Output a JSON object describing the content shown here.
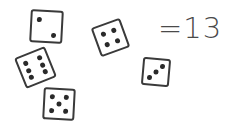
{
  "equation": {
    "text": "=13",
    "operator": "=",
    "value": "13"
  },
  "dice": [
    {
      "id": "die-two",
      "face_value": 2,
      "left": 30,
      "top": 10,
      "size": 33,
      "rotate": 3,
      "pips": [
        [
          25,
          28
        ],
        [
          75,
          78
        ]
      ]
    },
    {
      "id": "die-six",
      "face_value": 6,
      "left": 19,
      "top": 51,
      "size": 33,
      "rotate": -22,
      "pips": [
        [
          25,
          25
        ],
        [
          75,
          25
        ],
        [
          25,
          50
        ],
        [
          75,
          50
        ],
        [
          25,
          75
        ],
        [
          75,
          75
        ]
      ]
    },
    {
      "id": "die-five",
      "face_value": 5,
      "left": 43,
      "top": 88,
      "size": 32,
      "rotate": 3,
      "pips": [
        [
          25,
          25
        ],
        [
          75,
          25
        ],
        [
          50,
          50
        ],
        [
          25,
          75
        ],
        [
          75,
          75
        ]
      ]
    },
    {
      "id": "die-four",
      "face_value": 4,
      "left": 95,
      "top": 22,
      "size": 31,
      "rotate": -20,
      "pips": [
        [
          28,
          28
        ],
        [
          72,
          28
        ],
        [
          28,
          72
        ],
        [
          72,
          72
        ]
      ]
    },
    {
      "id": "die-three",
      "face_value": 3,
      "left": 142,
      "top": 58,
      "size": 28,
      "rotate": 5,
      "pips": [
        [
          75,
          25
        ],
        [
          50,
          50
        ],
        [
          25,
          75
        ]
      ]
    }
  ],
  "colors": {
    "ink": "#3a3a3a",
    "pip": "#2a2a2a",
    "text": "#4a4a4a",
    "background": "#ffffff"
  }
}
